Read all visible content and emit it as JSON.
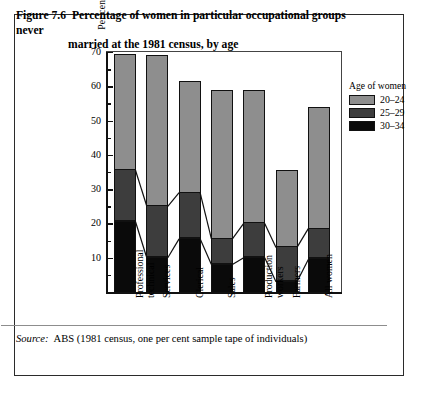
{
  "figure": {
    "number": "Figure 7.6",
    "title_line1": "Percentage of women in particular occupational groups never",
    "title_line2": "married at the 1981 census, by age",
    "source_label": "Source:",
    "source_text": "ABS (1981 census, one per cent sample tape of individuals)"
  },
  "legend": {
    "title": "Age of women",
    "items": [
      {
        "label": "20–24",
        "color": "#8e8e8e"
      },
      {
        "label": "25–29",
        "color": "#3d3d3d"
      },
      {
        "label": "30–34",
        "color": "#0a0a0a"
      }
    ]
  },
  "axes": {
    "ylabel": "Per cent never married",
    "yticks": [
      70,
      60,
      50,
      40,
      30,
      20,
      10
    ],
    "yminor": [
      65,
      55,
      45,
      35,
      25,
      15,
      5
    ],
    "ylim": [
      0,
      70
    ]
  },
  "chart_data": {
    "type": "bar",
    "subtype": "stacked-vertical",
    "title": "Percentage of women in particular occupational groups never married at the 1981 census, by age",
    "xlabel": "",
    "ylabel": "Per cent never married",
    "ylim": [
      0,
      70
    ],
    "yticks": [
      10,
      20,
      30,
      40,
      50,
      60,
      70
    ],
    "grid": false,
    "legend_position": "right",
    "categories": [
      "Professional/technical",
      "Services",
      "Clerical",
      "Sales",
      "Production workers",
      "Farmers",
      "All women"
    ],
    "category_label_lines": [
      [
        "Professional",
        "technical"
      ],
      [
        "Services"
      ],
      [
        "Clerical"
      ],
      [
        "Sales"
      ],
      [
        "Production",
        "workers"
      ],
      [
        "Farmers"
      ],
      [
        "All women"
      ]
    ],
    "series": [
      {
        "name": "20–24",
        "color": "#8e8e8e",
        "values": [
          69.5,
          69.0,
          61.5,
          59.0,
          59.0,
          35.5,
          54.0
        ]
      },
      {
        "name": "25–29",
        "color": "#3d3d3d",
        "values": [
          35.5,
          25.0,
          29.0,
          15.5,
          20.0,
          13.0,
          18.5
        ]
      },
      {
        "name": "30–34",
        "color": "#0a0a0a",
        "values": [
          20.5,
          10.0,
          15.5,
          8.0,
          10.0,
          3.0,
          9.5
        ]
      }
    ],
    "note": "series values are cumulative segment tops (per cent never married); topmost value is the total bar height"
  }
}
